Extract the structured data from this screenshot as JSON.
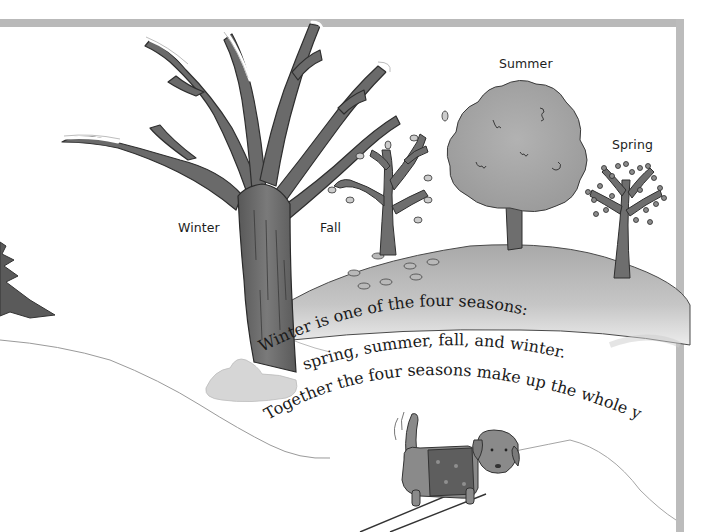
{
  "illustration": {
    "description": "Grayscale children's book illustration of four seasonal trees on a snowy landscape with a dog in a sweater",
    "labels": {
      "winter": "Winter",
      "fall": "Fall",
      "summer": "Summer",
      "spring": "Spring"
    },
    "caption_lines": [
      "Winter is one of the four seasons:",
      "spring, summer, fall, and winter.",
      "Together the four seasons make up the whole year."
    ],
    "colors": {
      "frame": "#b9b9b9",
      "trunk": "#6e6e6e",
      "foliage": "#a8a8a8",
      "hill": "#b4b4b4",
      "snow": "#ffffff",
      "text": "#1a1a1a",
      "dog": "#8a8a8a",
      "sweater": "#5e5e5e"
    }
  }
}
